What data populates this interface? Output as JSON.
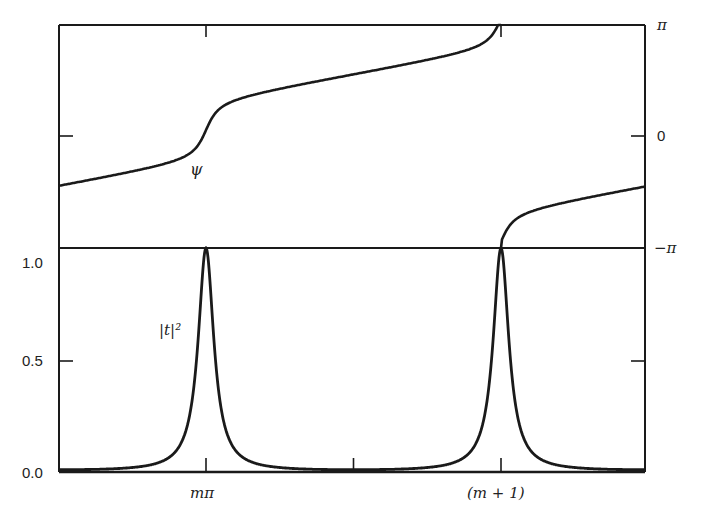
{
  "figure": {
    "background": "#ffffff",
    "ink": "#1a1a1a",
    "frame": {
      "left": 59,
      "top": 25,
      "right": 645,
      "bottom": 472,
      "divider_y": 248
    }
  },
  "labels": {
    "psi": "ψ",
    "t2": "|t|²",
    "left_ticks": [
      "1.0",
      "0.5",
      "0.0"
    ],
    "right_ticks": [
      "π",
      "0",
      "−π"
    ],
    "x_ticks": [
      "mπ",
      "(m + 1)"
    ]
  },
  "chart_data": [
    {
      "panel": "top",
      "type": "line",
      "title": "",
      "series": [
        {
          "name": "ψ",
          "label": "ψ"
        }
      ],
      "xlabel": "",
      "ylabel": "phase ψ",
      "x_axis": {
        "unit": "π",
        "range": [
          -0.5,
          1.49
        ],
        "ticks": [
          0,
          0.5,
          1
        ],
        "tick_labels": [
          "mπ",
          "",
          "(m + 1)"
        ]
      },
      "y_axis": {
        "range": [
          -3.1416,
          3.1416
        ],
        "position": "right",
        "ticks": [
          3.1416,
          0,
          -3.1416
        ],
        "tick_labels": [
          "π",
          "0",
          "−π"
        ]
      },
      "x": [
        -0.5,
        -0.4,
        -0.3,
        -0.2,
        -0.1,
        -0.05,
        0,
        0.05,
        0.1,
        0.2,
        0.3,
        0.4,
        0.5,
        0.6,
        0.7,
        0.8,
        0.9,
        0.95,
        1.0,
        1.05,
        1.1,
        1.2,
        1.3,
        1.4,
        1.49
      ],
      "y": [
        -1.55,
        -1.5,
        -1.43,
        -1.28,
        -0.93,
        -0.5,
        0.3,
        1.0,
        1.3,
        1.48,
        1.58,
        1.66,
        1.75,
        1.85,
        1.98,
        2.2,
        2.6,
        2.9,
        3.14,
        -2.2,
        -1.95,
        -1.75,
        -1.63,
        -1.57,
        -1.55
      ],
      "note": "phase wraps from +π to −π at x = m+1"
    },
    {
      "panel": "bottom",
      "type": "line",
      "title": "",
      "series": [
        {
          "name": "|t|²",
          "label": "|t|²"
        }
      ],
      "xlabel": "",
      "ylabel": "|t|²",
      "x_axis": {
        "unit": "π",
        "range": [
          -0.5,
          1.49
        ],
        "ticks": [
          0,
          0.5,
          1
        ],
        "tick_labels": [
          "mπ",
          "",
          "(m + 1)"
        ]
      },
      "y_axis": {
        "range": [
          0,
          1.0
        ],
        "position": "left",
        "ticks": [
          1.0,
          0.5,
          0.0
        ],
        "tick_labels": [
          "1.0",
          "0.5",
          "0.0"
        ]
      },
      "x": [
        -0.5,
        -0.4,
        -0.3,
        -0.2,
        -0.1,
        -0.05,
        -0.03,
        0,
        0.03,
        0.05,
        0.1,
        0.2,
        0.3,
        0.4,
        0.5,
        0.6,
        0.7,
        0.8,
        0.9,
        0.95,
        0.97,
        1.0,
        1.03,
        1.05,
        1.1,
        1.2,
        1.3,
        1.4,
        1.49
      ],
      "y": [
        0.01,
        0.012,
        0.02,
        0.05,
        0.15,
        0.42,
        0.67,
        1.0,
        0.67,
        0.42,
        0.15,
        0.05,
        0.02,
        0.012,
        0.01,
        0.012,
        0.02,
        0.05,
        0.15,
        0.42,
        0.67,
        1.0,
        0.67,
        0.42,
        0.15,
        0.05,
        0.02,
        0.012,
        0.01
      ],
      "model": {
        "form": "1/(1+F·sin²(πx))",
        "F": 98
      }
    }
  ]
}
